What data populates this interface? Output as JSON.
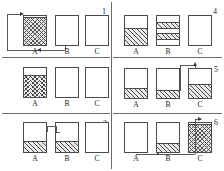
{
  "figure": {
    "panel_numbers": [
      "1",
      "2",
      "3",
      "4",
      "5",
      "6"
    ],
    "beaker_labels": [
      "A",
      "B",
      "C"
    ],
    "ink_color": "#4a4a4a",
    "fill_color": "#eceaea",
    "divider_color": "#6b6b6b"
  },
  "panels": [
    {
      "number": "1",
      "caption": "Beaker A full with coarse checkered contents; siphon tube from base of B loops up over the rim of A",
      "beakers": [
        {
          "label": "A",
          "fill_pattern": "checkered",
          "fill_from_percent": 6,
          "fill_to_percent": 100
        },
        {
          "label": "B",
          "fill_pattern": "none",
          "fill_from_percent": 0,
          "fill_to_percent": 0
        },
        {
          "label": "C",
          "fill_pattern": "none",
          "fill_from_percent": 0,
          "fill_to_percent": 0
        }
      ],
      "tube": {
        "from": "B",
        "to": "A",
        "arrow": "into-A-top",
        "extra_arrow": "left-under-A"
      }
    },
    {
      "number": "2",
      "caption": "Beaker A holds chevron-hatched liquid filling the lower two thirds; B and C empty",
      "beakers": [
        {
          "label": "A",
          "fill_pattern": "chevron",
          "fill_from_percent": 25,
          "fill_to_percent": 100
        },
        {
          "label": "B",
          "fill_pattern": "none",
          "fill_from_percent": 0,
          "fill_to_percent": 0
        },
        {
          "label": "C",
          "fill_pattern": "none",
          "fill_from_percent": 0,
          "fill_to_percent": 0
        }
      ],
      "tube": null
    },
    {
      "number": "3",
      "caption": "Beakers A and B each hold diagonally hatched liquid at equal low level, joined by a tube over the rims; C empty",
      "beakers": [
        {
          "label": "A",
          "fill_pattern": "diagonal",
          "fill_from_percent": 58,
          "fill_to_percent": 100
        },
        {
          "label": "B",
          "fill_pattern": "diagonal",
          "fill_from_percent": 58,
          "fill_to_percent": 100
        },
        {
          "label": "C",
          "fill_pattern": "none",
          "fill_from_percent": 0,
          "fill_to_percent": 0
        }
      ],
      "tube": {
        "from": "A",
        "to": "B",
        "arrow": "none",
        "extra_arrow": "none"
      }
    },
    {
      "number": "4",
      "caption": "Beaker A filled with diagonal hatching to just below half; beaker B shows two separated hatched bands",
      "beakers": [
        {
          "label": "A",
          "fill_pattern": "diagonal",
          "fill_from_percent": 40,
          "fill_to_percent": 100
        },
        {
          "label": "B",
          "fill_pattern": "banded",
          "fill_from_percent": 18,
          "fill_to_percent": 100
        },
        {
          "label": "C",
          "fill_pattern": "none",
          "fill_from_percent": 0,
          "fill_to_percent": 0
        }
      ],
      "tube": null
    },
    {
      "number": "5",
      "caption": "A and B hold shallow hatched liquid; a tube rises from B and bends down into C which holds a deeper hatched layer",
      "beakers": [
        {
          "label": "A",
          "fill_pattern": "diagonal",
          "fill_from_percent": 62,
          "fill_to_percent": 100
        },
        {
          "label": "B",
          "fill_pattern": "diagonal",
          "fill_from_percent": 68,
          "fill_to_percent": 100
        },
        {
          "label": "C",
          "fill_pattern": "diagonal",
          "fill_from_percent": 48,
          "fill_to_percent": 100
        }
      ],
      "tube": {
        "from": "B",
        "to": "C",
        "arrow": "into-C-top",
        "extra_arrow": "none"
      }
    },
    {
      "number": "6",
      "caption": "A empty, B holds a thin hatched layer, C is full of coarse checkered contents; tube runs from base of A past B and up into C",
      "beakers": [
        {
          "label": "A",
          "fill_pattern": "none",
          "fill_from_percent": 0,
          "fill_to_percent": 0
        },
        {
          "label": "B",
          "fill_pattern": "diagonal",
          "fill_from_percent": 66,
          "fill_to_percent": 100
        },
        {
          "label": "C",
          "fill_pattern": "checkered",
          "fill_from_percent": 6,
          "fill_to_percent": 100
        }
      ],
      "tube": {
        "from": "A",
        "to": "C",
        "arrow": "into-C-top",
        "extra_arrow": "none"
      }
    }
  ]
}
